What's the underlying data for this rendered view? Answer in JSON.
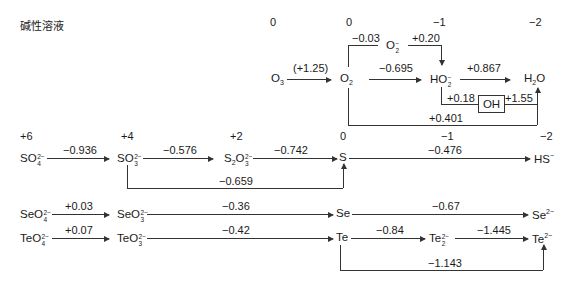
{
  "title": "碱性溶液",
  "oxygen": {
    "ox_states": [
      "0",
      "0",
      "−1",
      "−2"
    ],
    "species": {
      "O3": {
        "base": "O",
        "sub": "3",
        "sup": ""
      },
      "O2": {
        "base": "O",
        "sub": "2",
        "sup": ""
      },
      "O2m": {
        "base": "O",
        "sub": "2",
        "sup": "−"
      },
      "HO2m": {
        "base": "HO",
        "sub": "2",
        "sup": "−"
      },
      "H2O": {
        "pre": "H",
        "sub": "2",
        "post": "O"
      },
      "OH": "OH"
    },
    "potentials": {
      "O3_O2": "(+1.25)",
      "O2_O2m": "−0.03",
      "O2m_HO2m": "+0.20",
      "O2_HO2m": "−0.695",
      "HO2m_H2O": "+0.867",
      "HO2m_OH": "+0.18",
      "OH_H2O": "+1.55",
      "O2_H2O": "+0.401"
    }
  },
  "chalcogen_ox_states": [
    "+6",
    "+4",
    "+2",
    "0",
    "−1",
    "−2"
  ],
  "sulfur": {
    "species": {
      "SO4": {
        "base": "SO",
        "sub": "4",
        "sup": "2−"
      },
      "SO3": {
        "base": "SO",
        "sub": "3",
        "sup": "2−"
      },
      "S2O3": {
        "pre": "S",
        "sub1": "2",
        "base": "O",
        "sub": "3",
        "sup": "2−"
      },
      "S": "S",
      "HS": {
        "base": "HS",
        "sup": "−"
      }
    },
    "potentials": {
      "SO4_SO3": "−0.936",
      "SO3_S2O3": "−0.576",
      "S2O3_S": "−0.742",
      "S_HS": "−0.476",
      "SO3_S": "−0.659"
    }
  },
  "selenium": {
    "species": {
      "SeO4": {
        "base": "SeO",
        "sub": "4",
        "sup": "2−"
      },
      "SeO3": {
        "base": "SeO",
        "sub": "3",
        "sup": "2−"
      },
      "Se": "Se",
      "Se2m": {
        "base": "Se",
        "sup": "2−"
      }
    },
    "potentials": {
      "SeO4_SeO3": "+0.03",
      "SeO3_Se": "−0.36",
      "Se_Se2m": "−0.67"
    }
  },
  "tellurium": {
    "species": {
      "TeO4": {
        "base": "TeO",
        "sub": "4",
        "sup": "2−"
      },
      "TeO3": {
        "base": "TeO",
        "sub": "3",
        "sup": "2−"
      },
      "Te": "Te",
      "Te2": {
        "base": "Te",
        "sub": "2",
        "sup": "2−"
      },
      "Te2m": {
        "base": "Te",
        "sup": "2−"
      }
    },
    "potentials": {
      "TeO4_TeO3": "+0.07",
      "TeO3_Te": "−0.42",
      "Te_Te2": "−0.84",
      "Te2_Te2m": "−1.445",
      "Te_Te2m": "−1.143"
    }
  }
}
